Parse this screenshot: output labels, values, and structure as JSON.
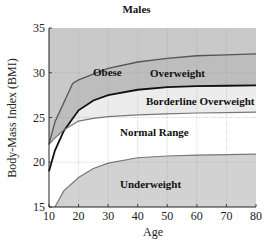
{
  "chart_data": {
    "type": "area",
    "title": "Males",
    "xlabel": "Age",
    "ylabel": "Body-Mass Index (BMI)",
    "xlim": [
      10,
      80
    ],
    "ylim": [
      15,
      35
    ],
    "xticks": [
      10,
      20,
      30,
      40,
      50,
      60,
      70,
      80
    ],
    "yticks": [
      15,
      20,
      25,
      30,
      35
    ],
    "grid": true,
    "regions": [
      {
        "name": "Obese",
        "color": "#c9c9c9"
      },
      {
        "name": "Overweight",
        "color": "#bdbdbd"
      },
      {
        "name": "Borderline Overweight",
        "color": "#ececec"
      },
      {
        "name": "Normal Range",
        "color": "#ffffff"
      },
      {
        "name": "Underweight",
        "color": "#d2d2d2"
      }
    ],
    "series": [
      {
        "name": "Obese / Overweight boundary",
        "x": [
          10,
          12,
          18,
          20,
          30,
          40,
          50,
          60,
          70,
          80
        ],
        "values": [
          22,
          24.5,
          28.8,
          29.2,
          30.5,
          31.2,
          31.6,
          31.9,
          32.0,
          32.1
        ]
      },
      {
        "name": "Overweight / Borderline boundary",
        "x": [
          10,
          12,
          15,
          20,
          25,
          30,
          40,
          50,
          60,
          70,
          80
        ],
        "values": [
          19,
          21.3,
          23.5,
          25.8,
          26.9,
          27.5,
          28.1,
          28.4,
          28.5,
          28.55,
          28.6
        ]
      },
      {
        "name": "Borderline / Normal boundary",
        "x": [
          10,
          12,
          15,
          20,
          25,
          30,
          40,
          50,
          60,
          70,
          80
        ],
        "values": [
          22,
          22.7,
          23.6,
          24.6,
          24.9,
          25.1,
          25.3,
          25.4,
          25.5,
          25.55,
          25.6
        ]
      },
      {
        "name": "Normal / Underweight boundary",
        "x": [
          12,
          15,
          20,
          25,
          30,
          40,
          50,
          60,
          70,
          80
        ],
        "values": [
          15,
          16.8,
          18.3,
          19.3,
          19.9,
          20.5,
          20.7,
          20.8,
          20.85,
          20.9
        ]
      }
    ],
    "annotations": [
      {
        "text": "Obese",
        "x": 27,
        "y": 32.4
      },
      {
        "text": "Overweight",
        "x": 57,
        "y": 29.6
      },
      {
        "text": "Borderline Overweight",
        "x": 60,
        "y": 26.8
      },
      {
        "text": "Normal Range",
        "x": 47,
        "y": 23.2
      },
      {
        "text": "Underweight",
        "x": 47,
        "y": 17.5
      }
    ]
  },
  "labels": {
    "title": "Males",
    "xlabel": "Age",
    "ylabel": "Body-Mass Index (BMI)",
    "xticks": [
      "10",
      "20",
      "30",
      "40",
      "50",
      "60",
      "70",
      "80"
    ],
    "yticks": [
      "15",
      "20",
      "25",
      "30",
      "35"
    ],
    "regions": {
      "obese": "Obese",
      "overweight": "Overweight",
      "borderline": "Borderline Overweight",
      "normal": "Normal Range",
      "underweight": "Underweight"
    }
  }
}
